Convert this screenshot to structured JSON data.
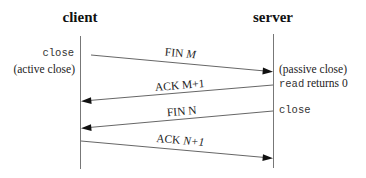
{
  "participants": {
    "client": {
      "label": "client"
    },
    "server": {
      "label": "server"
    }
  },
  "client_notes": {
    "close": "close",
    "active_close": "(active close)"
  },
  "server_notes": {
    "passive_close": "(passive close)",
    "read_prefix": "read",
    "read_suffix": " returns 0",
    "close": "close"
  },
  "messages": [
    {
      "label_main": "FIN ",
      "label_var": "M",
      "direction": "client-to-server"
    },
    {
      "label_main": "ACK M+1",
      "label_var": "",
      "direction": "server-to-client"
    },
    {
      "label_main": "FIN N",
      "label_var": "",
      "direction": "server-to-client"
    },
    {
      "label_main": "ACK ",
      "label_var": "N+1",
      "direction": "client-to-server"
    }
  ],
  "colors": {
    "timeline": "#777777",
    "arrow": "#555555",
    "text": "#222222"
  }
}
